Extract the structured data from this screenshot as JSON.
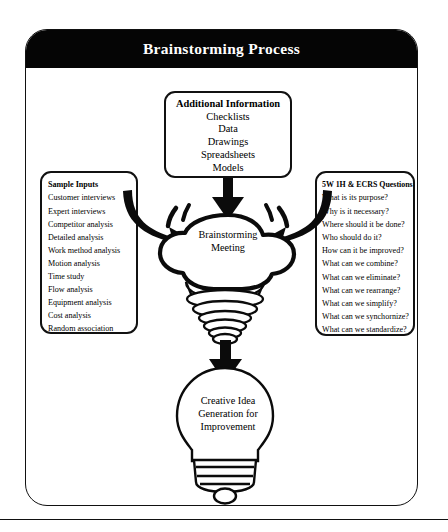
{
  "title": "Brainstorming Process",
  "additional_information": {
    "heading": "Additional Information",
    "items": [
      "Checklists",
      "Data",
      "Drawings",
      "Spreadsheets",
      "Models"
    ]
  },
  "sample_inputs": {
    "heading": "Sample Inputs",
    "items": [
      "Customer interviews",
      "Expert interviews",
      "Competitor analysis",
      "Detailed analysis",
      "Work method analysis",
      "Motion analysis",
      "Time study",
      "Flow analysis",
      "Equipment analysis",
      "Cost analysis",
      "Random association"
    ]
  },
  "questions": {
    "heading": "5W 1H & ECRS Questions",
    "items": [
      "What is its purpose?",
      "Why is it necessary?",
      "Where should it be done?",
      "Who should do it?",
      "How can it be improved?",
      "What can we combine?",
      "What can we eliminate?",
      "What can we rearrange?",
      "What can we simplify?",
      "What can we synchornize?",
      "What can we standardize?"
    ]
  },
  "center_node": {
    "line1": "Brainstorming",
    "line2": "Meeting"
  },
  "output_node": {
    "line1": "Creative Idea",
    "line2": "Generation for",
    "line3": "Improvement"
  },
  "colors": {
    "ink": "#111111",
    "title_bar": "#050505",
    "title_text": "#ffffff",
    "page": "#ffffff"
  }
}
